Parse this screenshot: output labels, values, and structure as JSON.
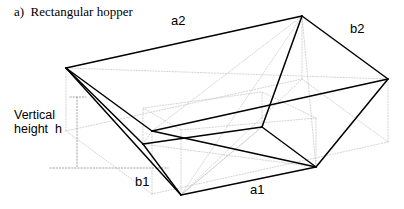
{
  "figure": {
    "caption": "a)  Rectangular hopper",
    "type": "engineering-line-drawing"
  },
  "labels": {
    "a2": "a2",
    "b2": "b2",
    "a1": "a1",
    "b1": "b1",
    "height": "Vertical\nheight  h"
  },
  "colors": {
    "stroke_solid": "#000000",
    "stroke_hidden": "#aaaaaa",
    "stroke_faint": "#cccccc",
    "background": "#ffffff",
    "text": "#000000"
  },
  "geometry": {
    "top_rim": [
      [
        66,
        68
      ],
      [
        302,
        16
      ],
      [
        388,
        79
      ],
      [
        152,
        131
      ]
    ],
    "bottom_outlet": [
      [
        143,
        144
      ],
      [
        262,
        127
      ],
      [
        316,
        167
      ],
      [
        181,
        195
      ]
    ],
    "height_line": {
      "x": 77,
      "y_top": 97,
      "y_bottom": 168,
      "tick_right_x": 168
    }
  }
}
